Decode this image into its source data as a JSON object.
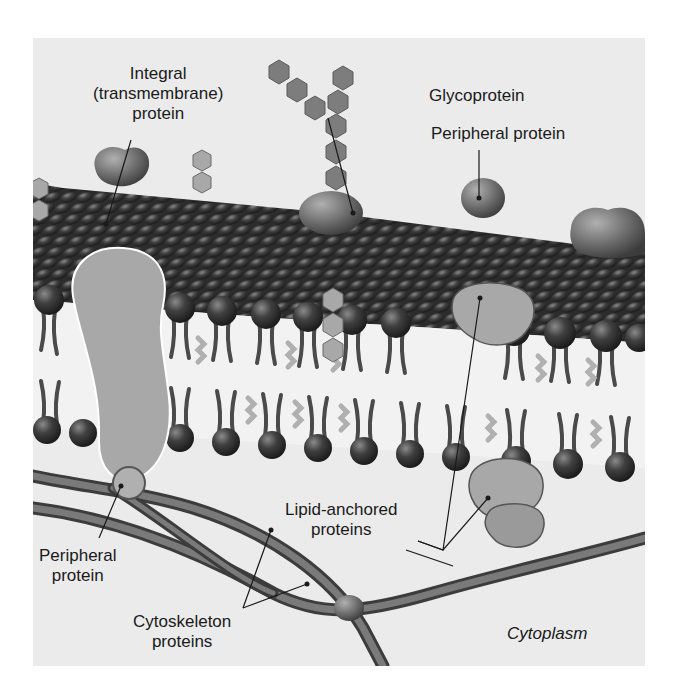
{
  "figure": {
    "colors": {
      "background": "#ebebeb",
      "phospholipid_head": "#3a3a3a",
      "protein_fill": "#a8a8a8",
      "carbohydrate": "#7d7d7d",
      "cholesterol": "#b5b5b5",
      "cytoskeleton": "#5a5a5a",
      "label_text": "#1a1a1a"
    },
    "labels": {
      "integral_line1": "Integral",
      "integral_line2": "(transmembrane)",
      "integral_line3": "protein",
      "glycoprotein": "Glycoprotein",
      "peripheral_top": "Peripheral protein",
      "lipid_anchored_line1": "Lipid-anchored",
      "lipid_anchored_line2": "proteins",
      "peripheral_bottom_line1": "Peripheral",
      "peripheral_bottom_line2": "protein",
      "cytoskeleton_line1": "Cytoskeleton",
      "cytoskeleton_line2": "proteins",
      "cytoplasm": "Cytoplasm"
    }
  }
}
